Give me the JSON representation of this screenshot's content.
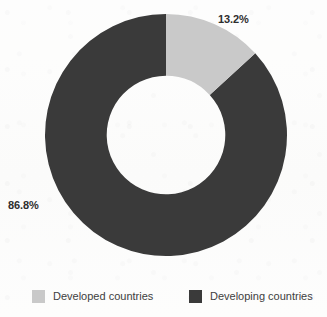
{
  "chart_data": {
    "type": "pie",
    "variant": "donut",
    "title": "",
    "subtitle": "",
    "xlabel": "",
    "ylabel": "",
    "categories": [
      "Developed countries",
      "Developing countries"
    ],
    "values": [
      13.2,
      86.8
    ],
    "unit": "%",
    "data_labels": [
      "13.2%",
      "86.8%"
    ],
    "colors": [
      "#c9c9c9",
      "#3a3a3a"
    ],
    "start_angle_deg": 0,
    "direction": "clockwise",
    "inner_radius_ratio": 0.49,
    "legend": {
      "position": "bottom",
      "entries": [
        {
          "label": "Developed countries",
          "color": "#c9c9c9",
          "value": 13.2
        },
        {
          "label": "Developing countries",
          "color": "#3a3a3a",
          "value": 86.8
        }
      ]
    },
    "grid": false,
    "annotations": [
      {
        "text": "13.2%",
        "anchor": "outside-top-right",
        "series": "Developed countries"
      },
      {
        "text": "86.8%",
        "anchor": "outside-left",
        "series": "Developing countries"
      }
    ]
  },
  "labels": {
    "developed_pct": "13.2%",
    "developing_pct": "86.8%"
  },
  "legend": {
    "developed": "Developed countries",
    "developing": "Developing countries"
  },
  "colors": {
    "developed": "#c9c9c9",
    "developing": "#3a3a3a",
    "label_text": "#2e2e2e",
    "legend_text": "#404040",
    "background": "#fdfdfc"
  }
}
